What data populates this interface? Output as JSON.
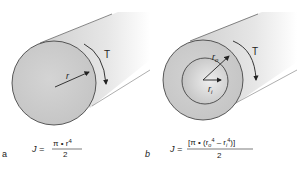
{
  "figure": {
    "panels": [
      {
        "id": "a",
        "label": "a",
        "type": "solid-shaft",
        "radius_label": "r",
        "torque_label": "T",
        "formula": {
          "lhs": "J =",
          "numerator": "π • r",
          "numerator_exp": "4",
          "denominator": "2"
        }
      },
      {
        "id": "b",
        "label": "b",
        "type": "hollow-shaft",
        "outer_radius_label": "r",
        "outer_radius_sub": "o",
        "inner_radius_label": "r",
        "inner_radius_sub": "i",
        "torque_label": "T",
        "formula": {
          "lhs": "J =",
          "numerator_open": "[π • (r",
          "numerator_sub_o": "o",
          "numerator_exp_1": "4",
          "numerator_minus": " – r",
          "numerator_sub_i": "i",
          "numerator_exp_2": "4",
          "numerator_close": ")]",
          "denominator": "2"
        }
      }
    ],
    "colors": {
      "face": "#c9c9c9",
      "body_light": "#f4f4f4",
      "body_dark": "#bdbdbd",
      "outline": "#333333",
      "text": "#222222"
    }
  }
}
